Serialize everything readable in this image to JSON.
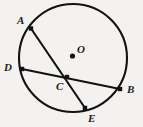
{
  "figure": {
    "type": "geometry-circle-diagram",
    "background_color": "#f4f2f0",
    "stroke_color": "#121212",
    "circle": {
      "center_label": "O",
      "center_x": 73,
      "center_y": 58,
      "radius": 54,
      "stroke_width": 2.1
    },
    "center_dot": {
      "label": "O",
      "x": 72.5,
      "y": 56,
      "radius": 2.6,
      "label_x": 77,
      "label_y": 44
    },
    "points": [
      {
        "id": "A",
        "label": "A",
        "x": 31,
        "y": 28.5,
        "label_x": 17,
        "label_y": 15,
        "marker": "square"
      },
      {
        "id": "D",
        "label": "D",
        "x": 22,
        "y": 69,
        "label_x": 4,
        "label_y": 62,
        "marker": "square"
      },
      {
        "id": "C",
        "label": "C",
        "x": 67,
        "y": 77,
        "label_x": 56,
        "label_y": 81,
        "marker": "square"
      },
      {
        "id": "B",
        "label": "B",
        "x": 120,
        "y": 89,
        "label_x": 127,
        "label_y": 84,
        "marker": "square"
      },
      {
        "id": "E",
        "label": "E",
        "x": 85,
        "y": 108,
        "label_x": 88,
        "label_y": 113,
        "marker": "square"
      }
    ],
    "chords": [
      {
        "id": "AE",
        "from": "A",
        "to": "E",
        "x1": 31,
        "y1": 28.5,
        "x2": 85,
        "y2": 108,
        "stroke_width": 2.1
      },
      {
        "id": "DB",
        "from": "D",
        "to": "B",
        "x1": 22,
        "y1": 69,
        "x2": 120,
        "y2": 89,
        "stroke_width": 2.1
      }
    ],
    "marker_size": 4.4
  }
}
